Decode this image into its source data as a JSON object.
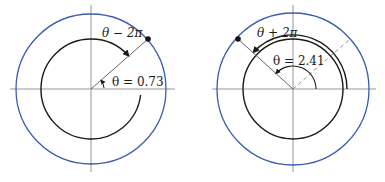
{
  "diagrams": [
    {
      "id": "left",
      "theta_label": "θ = 0.73",
      "arc_label": "θ − 2π",
      "theta_value": 0.73
    },
    {
      "id": "right",
      "theta_label": "θ = 2.41",
      "arc_label": "θ + 2π",
      "theta_value": 2.41
    }
  ],
  "colors": {
    "outer_circle": "#3a5bb0",
    "curve": "#1a1a1a",
    "axis": "#8a8a8a",
    "ray": "#555555"
  }
}
